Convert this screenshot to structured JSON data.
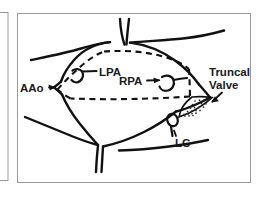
{
  "figure": {
    "panel_border_color": "#9a9a9a",
    "ink_color": "#111111",
    "background_color": "#ffffff",
    "stipple_color": "#2a2a2a"
  },
  "labels": {
    "aao": "AAo",
    "lpa": "LPA",
    "rpa": "RPA",
    "truncal_line1": "Truncal",
    "truncal_line2": "Valve",
    "lc": "LC"
  },
  "annotations": {
    "dashed_outline_name": "resection-outline",
    "stipple_patch_name": "truncal-valve-patch",
    "coronary_ostium_name": "left-coronary-ostium"
  }
}
